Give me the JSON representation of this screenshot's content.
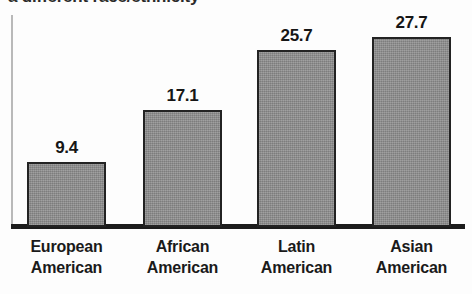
{
  "figure": {
    "clipped_top_text": "a different race/ethnicity"
  },
  "chart_data": {
    "type": "bar",
    "title": "",
    "subtitle": "",
    "xlabel": "",
    "ylabel": "",
    "categories": [
      "European American",
      "African American",
      "Latin American",
      "Asian American"
    ],
    "category_lines": [
      [
        "European",
        "American"
      ],
      [
        "African",
        "American"
      ],
      [
        "Latin",
        "American"
      ],
      [
        "Asian",
        "American"
      ]
    ],
    "values": [
      9.4,
      17.1,
      25.7,
      27.7
    ],
    "value_labels": [
      "9.4",
      "17.1",
      "25.7",
      "27.7"
    ],
    "ylim": [
      0,
      31
    ],
    "grid": false,
    "legend": null,
    "bar_fill_color": "#8a8a8a",
    "bar_edge_color": "#232323",
    "axis_color": "#1c1c1c"
  }
}
